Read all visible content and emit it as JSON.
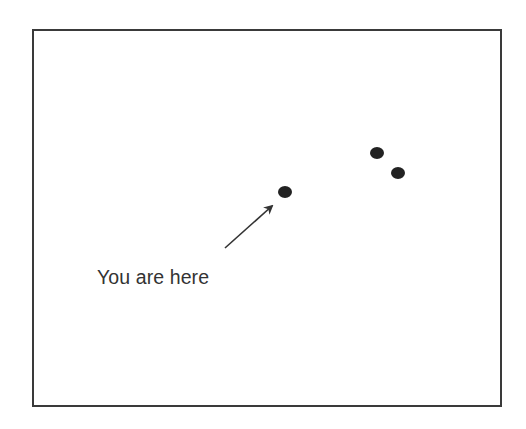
{
  "diagram": {
    "type": "map-marker-illustration",
    "frame": {
      "stroke_color": "#3a3a3a",
      "fill_color": "#ffffff"
    },
    "label": {
      "text": "You are here",
      "color": "#333333"
    },
    "points": [
      {
        "id": "you-are-here",
        "cx": 285,
        "cy": 192,
        "rx": 7,
        "ry": 6,
        "color": "#222222"
      },
      {
        "id": "point-2",
        "cx": 377,
        "cy": 153,
        "rx": 7,
        "ry": 6,
        "color": "#222222"
      },
      {
        "id": "point-3",
        "cx": 398,
        "cy": 173,
        "rx": 7,
        "ry": 6,
        "color": "#222222"
      }
    ],
    "arrow": {
      "x1": 225,
      "y1": 248,
      "x2": 272,
      "y2": 206,
      "color": "#333333"
    }
  }
}
